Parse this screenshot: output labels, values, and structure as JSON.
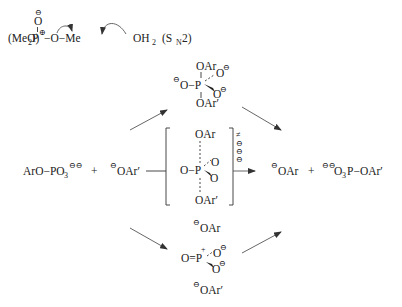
{
  "figure": {
    "sn2_example": {
      "oxide": "O",
      "oxide_charge": "⊖",
      "reagent": "(MeO)",
      "reagent_sub": "2",
      "phosphorus": "P",
      "p_charge": "⊕",
      "leaving": "O−Me",
      "nucleophile": "OH",
      "nucleophile_sub": "2",
      "mechanism_label_open": "(S",
      "mechanism_label_sub": "N",
      "mechanism_label_close": "2)"
    },
    "reactants": {
      "substrate": "ArO−PO",
      "substrate_sub": "3",
      "substrate_charge": "⊖⊖",
      "plus": "+",
      "nucleophile_charge": "⊖",
      "nucleophile": "OAr′"
    },
    "associative_intermediate": {
      "top": "OAr",
      "top_o": "O",
      "top_o_charge": "⊖",
      "left": "O−P",
      "left_charge": "⊖",
      "right_o": "O",
      "right_o_charge": "⊖",
      "bottom": "OAr′"
    },
    "transition_state": {
      "top": "OAr",
      "left": "O−P",
      "o_upper": "O",
      "o_lower": "O",
      "bottom": "OAr′",
      "ts_symbol": "≠",
      "charges": [
        "⊖",
        "⊖",
        "⊖"
      ]
    },
    "dissociative_intermediate": {
      "top_charge": "⊖",
      "top": "OAr",
      "left": "O=P",
      "p_charge": "+",
      "o_upper": "O",
      "o_upper_charge": "⊖",
      "o_lower": "O",
      "o_lower_charge": "⊖",
      "bottom_charge": "⊖",
      "bottom": "OAr′"
    },
    "products": {
      "leaving_charge": "⊖",
      "leaving": "OAr",
      "plus": "+",
      "product_charge": "⊖⊖",
      "product": "O",
      "product_sub": "3",
      "product_rest": "P−OAr′"
    }
  }
}
